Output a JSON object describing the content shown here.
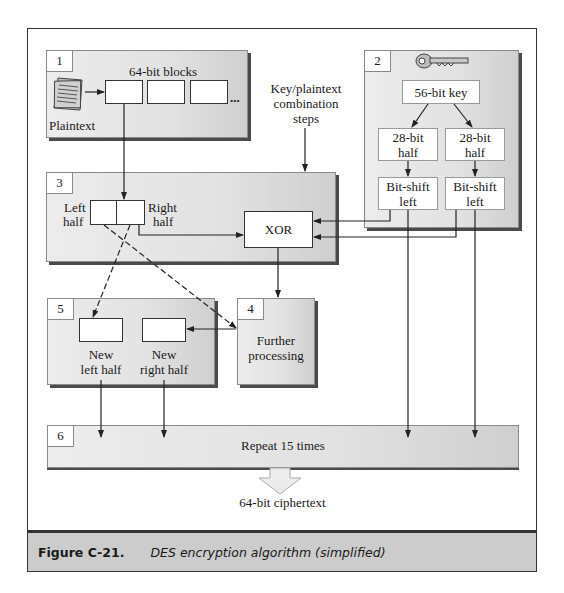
{
  "figure": {
    "caption_label": "Figure C-21.",
    "caption_text": "DES encryption algorithm (simplified)"
  },
  "step1": {
    "number": "1",
    "title": "64-bit blocks",
    "plaintext_label": "Plaintext",
    "ellipsis": "...",
    "icon": "document-icon"
  },
  "step2": {
    "number": "2",
    "icon": "key-icon",
    "key_label": "56-bit key",
    "half_left": [
      "28-bit",
      "half"
    ],
    "half_right": [
      "28-bit",
      "half"
    ],
    "shift_left": [
      "Bit-shift",
      "left"
    ],
    "shift_right": [
      "Bit-shift",
      "left"
    ]
  },
  "combination": {
    "label": [
      "Key/plaintext",
      "combination",
      "steps"
    ]
  },
  "step3": {
    "number": "3",
    "left_half": [
      "Left",
      "half"
    ],
    "right_half": [
      "Right",
      "half"
    ],
    "xor_label": "XOR"
  },
  "step4": {
    "number": "4",
    "label": [
      "Further",
      "processing"
    ]
  },
  "step5": {
    "number": "5",
    "new_left": [
      "New",
      "left half"
    ],
    "new_right": [
      "New",
      "right half"
    ]
  },
  "step6": {
    "number": "6",
    "label": "Repeat 15 times"
  },
  "output": {
    "label": "64-bit ciphertext"
  }
}
